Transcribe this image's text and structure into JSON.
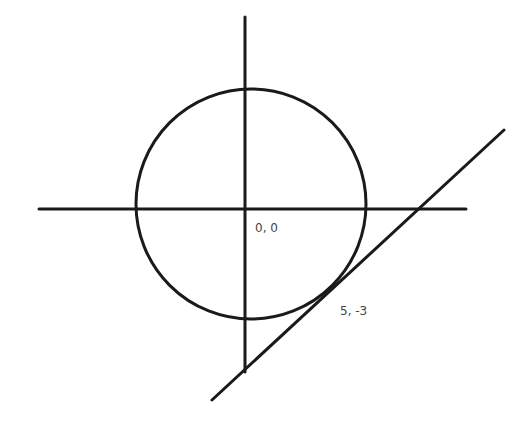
{
  "diagram": {
    "colors": {
      "stroke": "#1a1a1a",
      "label": "#444444",
      "background": "#ffffff"
    },
    "axes": {
      "vertical": {
        "x1": 245,
        "y1": 17,
        "x2": 245,
        "y2": 372
      },
      "horizontal": {
        "x1": 39,
        "y1": 209,
        "x2": 466,
        "y2": 209
      }
    },
    "circle": {
      "cx": 251,
      "cy": 204,
      "r": 115
    },
    "tangent_line": {
      "x1": 212,
      "y1": 400,
      "x2": 504,
      "y2": 130
    },
    "labels": {
      "origin": {
        "text": "0, 0",
        "x": 255,
        "y": 232
      },
      "tangent_point": {
        "text": "5, -3",
        "x": 340,
        "y": 315
      }
    }
  }
}
